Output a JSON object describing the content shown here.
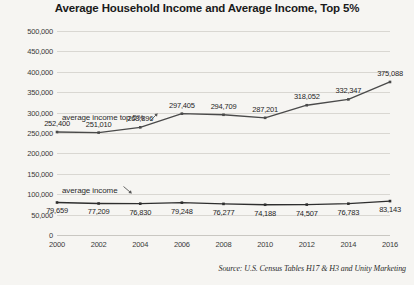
{
  "chart_data": {
    "type": "line",
    "title": "Average Household Income and Average Income, Top 5%",
    "xlabel": "",
    "ylabel": "",
    "categories": [
      "2000",
      "2002",
      "2004",
      "2006",
      "2008",
      "2010",
      "2012",
      "2014",
      "2016"
    ],
    "x": [
      2000,
      2002,
      2004,
      2006,
      2008,
      2010,
      2012,
      2014,
      2016
    ],
    "ylim": [
      0,
      500000
    ],
    "ytick_step": 50000,
    "ytick_labels": [
      "500,000",
      "450,000",
      "400,000",
      "350,000",
      "300,000",
      "250,000",
      "200,000",
      "150,000",
      "100,000",
      "50,000",
      "0"
    ],
    "ytick_values": [
      500000,
      450000,
      400000,
      350000,
      300000,
      250000,
      200000,
      150000,
      100000,
      50000,
      0
    ],
    "grid": true,
    "legend_position": "inline-annotations",
    "series": [
      {
        "name": "average income top 5%",
        "color": "#4a4a4a",
        "values": [
          252400,
          251010,
          263896,
          297405,
          294709,
          287201,
          318052,
          332347,
          375088
        ],
        "labels": [
          "252,400",
          "251,010",
          "263,896",
          "297,405",
          "294,709",
          "287,201",
          "318,052",
          "332,347",
          "375,088"
        ]
      },
      {
        "name": "average income",
        "color": "#2e2e2e",
        "values": [
          79659,
          77209,
          76830,
          79248,
          76277,
          74188,
          74507,
          76783,
          83143
        ],
        "labels": [
          "79,659",
          "77,209",
          "76,830",
          "79,248",
          "76,277",
          "74,188",
          "74,507",
          "76,783",
          "83,143"
        ]
      }
    ],
    "annotations": [
      {
        "text": "average income top 5%",
        "arrow": "up-right"
      },
      {
        "text": "average income",
        "arrow": "down-right"
      }
    ],
    "source": "Source: U.S. Census Tables H17 & H3 and Unity Marketing"
  },
  "colors": {
    "background": "#f6f5f2",
    "gridline": "#d9d7d2",
    "text": "#231f20",
    "series_top": "#4a4a4a",
    "series_bottom": "#2e2e2e"
  }
}
